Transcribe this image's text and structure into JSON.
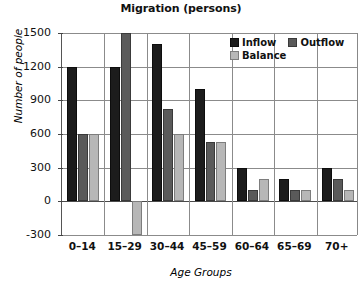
{
  "chart_data": {
    "type": "bar",
    "title": "Migration (persons)",
    "xlabel": "Age Groups",
    "ylabel": "Number of people",
    "categories": [
      "0–14",
      "15–29",
      "30–44",
      "45–59",
      "60–64",
      "65–69",
      "70+"
    ],
    "series": [
      {
        "name": "Inflow",
        "color": "#1c1c1c",
        "values": [
          1200,
          1200,
          1400,
          1000,
          300,
          200,
          300
        ]
      },
      {
        "name": "Outflow",
        "color": "#5a5a5a",
        "values": [
          600,
          1500,
          820,
          530,
          100,
          100,
          200
        ]
      },
      {
        "name": "Balance",
        "color": "#b7b7b7",
        "values": [
          600,
          -300,
          600,
          530,
          200,
          100,
          100
        ]
      }
    ],
    "ylim": [
      -300,
      1500
    ],
    "yticks": [
      1500,
      1200,
      900,
      600,
      300,
      0,
      -300
    ],
    "ytick_labels": [
      "1500",
      "1200",
      "900",
      "600",
      "300",
      "0",
      "-300"
    ],
    "grid": true,
    "legend_position": "top-right"
  }
}
